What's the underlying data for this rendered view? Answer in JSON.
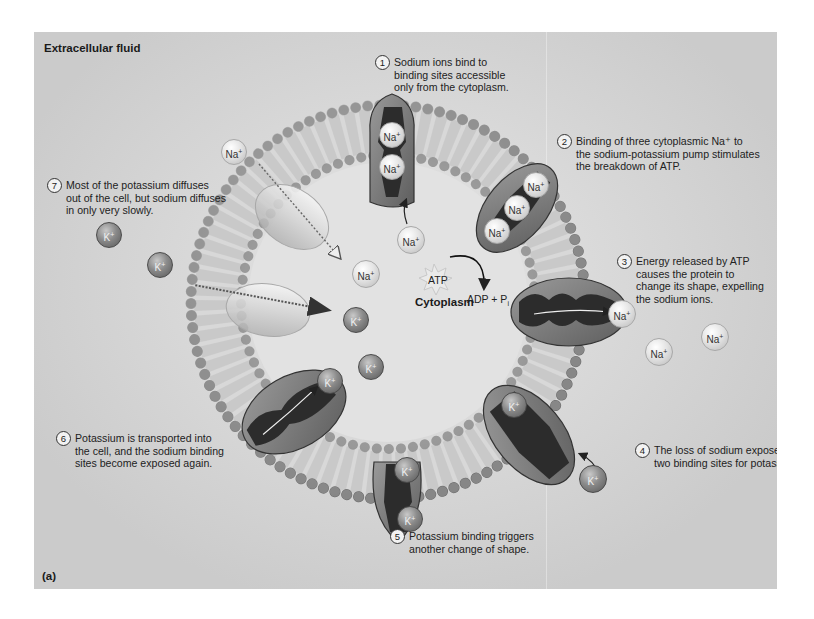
{
  "figure": {
    "panel_label": "(a)",
    "region_labels": {
      "extracellular": "Extracellular fluid",
      "cytoplasm": "Cytoplasm"
    },
    "steps": [
      {
        "number": "1",
        "text": "Sodium ions bind to\nbinding sites accessible\nonly from the cytoplasm."
      },
      {
        "number": "2",
        "text": "Binding of three cytoplasmic Na⁺ to\nthe sodium-potassium pump stimulates\nthe breakdown of ATP."
      },
      {
        "number": "3",
        "text": "Energy released by ATP\ncauses the protein to\nchange its shape, expelling\nthe sodium ions."
      },
      {
        "number": "4",
        "text": "The loss of sodium exposes\ntwo binding sites for potassium."
      },
      {
        "number": "5",
        "text": "Potassium binding triggers\nanother change of shape."
      },
      {
        "number": "6",
        "text": "Potassium is transported into\nthe cell, and the sodium binding\nsites become exposed again."
      },
      {
        "number": "7",
        "text": "Most of the potassium diffuses\nout of the cell, but sodium diffuses\nin only very slowly."
      }
    ],
    "ions": {
      "sodium": {
        "symbol": "Na",
        "charge": "+"
      },
      "potassium": {
        "symbol": "K",
        "charge": "+"
      }
    },
    "reaction": {
      "reactant": "ATP",
      "products": "ADP + P",
      "products_subscript": "i"
    },
    "colors": {
      "background": "#cbcbcb",
      "protein": "#7a7a7a",
      "protein_interior": "#2c2c2c",
      "phospholipid_head": "#9a9a9a",
      "sodium_ion": "#e4e4e4",
      "potassium_ion": "#7a7a7a"
    }
  }
}
